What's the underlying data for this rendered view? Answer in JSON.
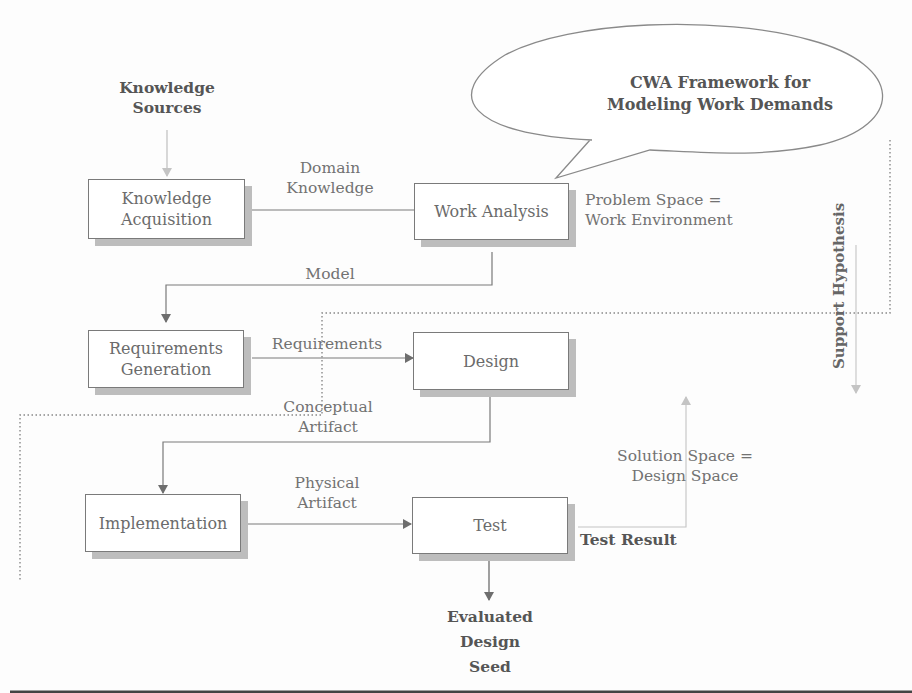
{
  "diagram": {
    "title_bubble": {
      "line1": "CWA Framework for",
      "line2": "Modeling Work Demands"
    },
    "knowledge_sources": {
      "line1": "Knowledge",
      "line2": "Sources"
    },
    "boxes": {
      "knowledge_acquisition": {
        "line1": "Knowledge",
        "line2": "Acquisition"
      },
      "work_analysis": {
        "label": "Work Analysis"
      },
      "requirements_generation": {
        "line1": "Requirements",
        "line2": "Generation"
      },
      "design": {
        "label": "Design"
      },
      "implementation": {
        "label": "Implementation"
      },
      "test": {
        "label": "Test"
      }
    },
    "edges": {
      "domain_knowledge": {
        "line1": "Domain",
        "line2": "Knowledge"
      },
      "model": "Model",
      "requirements": "Requirements",
      "conceptual_artifact": {
        "line1": "Conceptual",
        "line2": "Artifact"
      },
      "physical_artifact": {
        "line1": "Physical",
        "line2": "Artifact"
      },
      "test_result": "Test Result"
    },
    "annotations": {
      "problem_space": {
        "line1": "Problem Space =",
        "line2": "Work Environment"
      },
      "solution_space": {
        "line1": "Solution Space =",
        "line2": "Design Space"
      },
      "support_hypothesis": "Support Hypothesis"
    },
    "output": {
      "line1": "Evaluated",
      "line2": "Design",
      "line3": "Seed"
    }
  }
}
